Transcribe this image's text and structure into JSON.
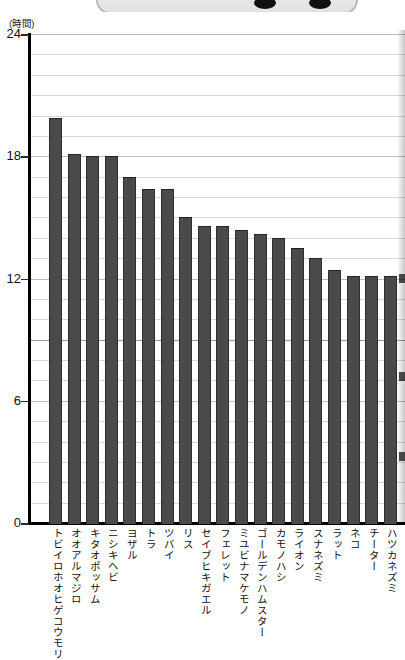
{
  "chart_data": {
    "type": "bar",
    "title": "",
    "subtitle": "",
    "xlabel": "",
    "ylabel": "(時間)",
    "unit_label": "(時間)",
    "ylim": [
      0,
      24
    ],
    "yticks": [
      0,
      6,
      12,
      18,
      24
    ],
    "ytick_labels": [
      "0",
      "6",
      "12",
      "18",
      "24"
    ],
    "minor_gridline_step": 1,
    "grid": true,
    "legend": "none",
    "categories": [
      "トビイロホオヒゲコウモリ",
      "オオアルマジロ",
      "キタオポッサム",
      "ニシキヘビ",
      "ヨザル",
      "トラ",
      "ツバイ",
      "リス",
      "セイブヒキガエル",
      "フェレット",
      "ミユビナマケモノ",
      "ゴールデンハムスター",
      "カモノハシ",
      "ライオン",
      "スナネズミ",
      "ラット",
      "ネコ",
      "チーター",
      "ハツカネズミ"
    ],
    "values": [
      19.9,
      18.1,
      18.0,
      18.0,
      17.0,
      16.4,
      16.4,
      15.0,
      14.6,
      14.6,
      14.4,
      14.2,
      14.0,
      13.5,
      13.0,
      12.4,
      12.1,
      12.1,
      12.1
    ],
    "bar_color": "#4a4a4a",
    "grid_color": "#d7d7d7",
    "axis_color": "#000000"
  }
}
